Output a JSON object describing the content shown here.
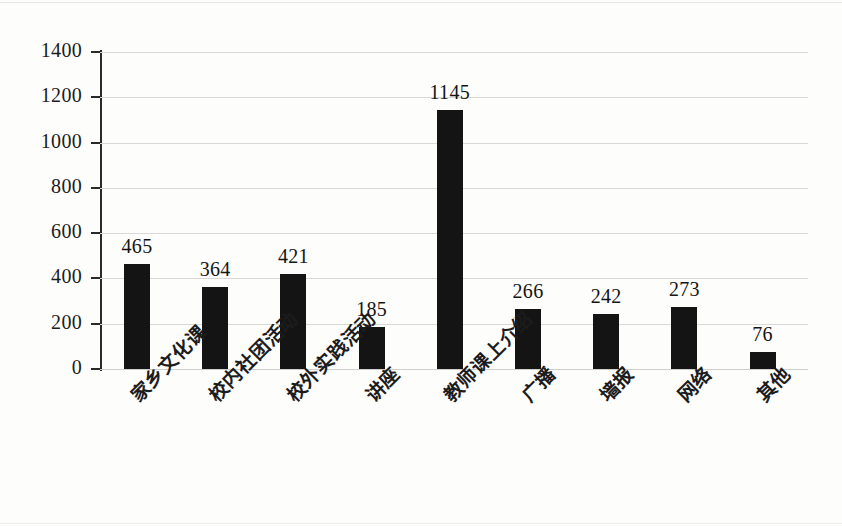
{
  "chart_data": {
    "type": "bar",
    "title": "",
    "subtitle": "",
    "xlabel": "",
    "ylabel": "",
    "ylim": [
      0,
      1400
    ],
    "ytick_step": 200,
    "yticks": [
      "1400",
      "1200",
      "1000",
      "800",
      "600",
      "400",
      "200",
      "0"
    ],
    "grid": true,
    "legend": "none",
    "bar_color": "#141414",
    "gridline_color": "#d8d8d6",
    "axis_color": "#2a2a2a",
    "categories": [
      "家乡文化课",
      "校内社团活动",
      "校外实践活动",
      "讲座",
      "教师课上介绍",
      "广播",
      "墙报",
      "网络",
      "其他"
    ],
    "values": [
      465,
      364,
      421,
      185,
      1145,
      266,
      242,
      273,
      76
    ],
    "value_labels": [
      "465",
      "364",
      "421",
      "185",
      "1145",
      "266",
      "242",
      "273",
      "76"
    ]
  }
}
